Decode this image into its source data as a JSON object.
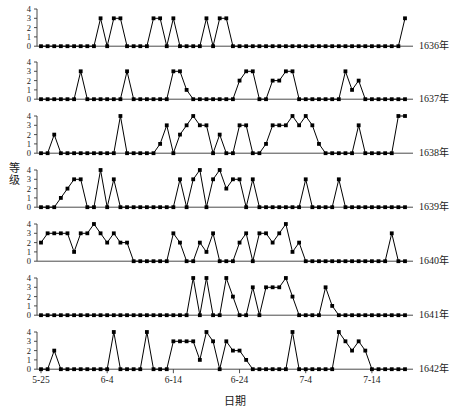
{
  "chart_data": {
    "type": "line",
    "title": "",
    "xlabel": "日期",
    "ylabel": "等级",
    "ylim": [
      0,
      4
    ],
    "yticks": [
      0,
      1,
      2,
      3,
      4
    ],
    "grid": false,
    "legend_position": "right",
    "x_start_label": "5-25",
    "x_tick_labels": [
      "5-25",
      "6-4",
      "6-14",
      "6-24",
      "7-4",
      "7-14"
    ],
    "x_tick_indices": [
      0,
      10,
      20,
      30,
      40,
      50
    ],
    "n_points": 56,
    "series": [
      {
        "name": "1636年",
        "values": [
          0,
          0,
          0,
          0,
          0,
          0,
          0,
          0,
          0,
          3,
          0,
          3,
          3,
          0,
          0,
          0,
          0,
          3,
          3,
          0,
          3,
          0,
          0,
          0,
          0,
          3,
          0,
          3,
          3,
          0,
          0,
          0,
          0,
          0,
          0,
          0,
          0,
          0,
          0,
          0,
          0,
          0,
          0,
          0,
          0,
          0,
          0,
          0,
          0,
          0,
          0,
          0,
          0,
          0,
          0,
          3
        ]
      },
      {
        "name": "1637年",
        "values": [
          0,
          0,
          0,
          0,
          0,
          0,
          3,
          0,
          0,
          0,
          0,
          0,
          0,
          3,
          0,
          0,
          0,
          0,
          0,
          0,
          3,
          3,
          1,
          0,
          0,
          0,
          0,
          0,
          0,
          0,
          2,
          3,
          3,
          0,
          0,
          2,
          2,
          3,
          3,
          0,
          0,
          0,
          0,
          0,
          0,
          0,
          3,
          1,
          2,
          0,
          0,
          0,
          0,
          0,
          0,
          0
        ]
      },
      {
        "name": "1638年",
        "values": [
          0,
          0,
          2,
          0,
          0,
          0,
          0,
          0,
          0,
          0,
          0,
          0,
          4,
          0,
          0,
          0,
          0,
          0,
          1,
          3,
          0,
          2,
          3,
          4,
          3,
          3,
          0,
          2,
          0,
          0,
          3,
          3,
          0,
          0,
          1,
          3,
          3,
          3,
          4,
          3,
          4,
          3,
          1,
          0,
          0,
          0,
          0,
          0,
          3,
          0,
          0,
          0,
          0,
          0,
          4,
          4
        ]
      },
      {
        "name": "1639年",
        "values": [
          0,
          0,
          0,
          1,
          2,
          3,
          3,
          0,
          0,
          4,
          0,
          3,
          0,
          0,
          0,
          0,
          0,
          0,
          0,
          0,
          0,
          3,
          0,
          3,
          4,
          0,
          3,
          4,
          2,
          3,
          3,
          0,
          3,
          0,
          0,
          0,
          0,
          0,
          0,
          0,
          3,
          0,
          0,
          0,
          0,
          3,
          0,
          0,
          0,
          0,
          0,
          0,
          0,
          0,
          0,
          0
        ]
      },
      {
        "name": "1640年",
        "values": [
          2,
          3,
          3,
          3,
          3,
          1,
          3,
          3,
          4,
          3,
          2,
          3,
          2,
          2,
          0,
          0,
          0,
          0,
          0,
          0,
          3,
          2,
          0,
          0,
          2,
          1,
          3,
          0,
          0,
          0,
          2,
          3,
          0,
          3,
          3,
          2,
          3,
          4,
          1,
          2,
          0,
          0,
          0,
          0,
          0,
          0,
          0,
          0,
          0,
          0,
          0,
          0,
          0,
          3,
          0,
          0
        ]
      },
      {
        "name": "1641年",
        "values": [
          0,
          0,
          0,
          0,
          0,
          0,
          0,
          0,
          0,
          0,
          0,
          0,
          0,
          0,
          0,
          0,
          0,
          0,
          0,
          0,
          0,
          0,
          0,
          4,
          0,
          4,
          0,
          0,
          4,
          2,
          0,
          0,
          3,
          0,
          3,
          3,
          3,
          4,
          2,
          0,
          0,
          0,
          0,
          3,
          1,
          0,
          0,
          0,
          0,
          0,
          0,
          0,
          0,
          0,
          0,
          0
        ]
      },
      {
        "name": "1642年",
        "values": [
          0,
          0,
          2,
          0,
          0,
          0,
          0,
          0,
          0,
          0,
          0,
          4,
          0,
          0,
          0,
          0,
          4,
          0,
          0,
          0,
          3,
          3,
          3,
          3,
          1,
          4,
          3,
          0,
          3,
          2,
          2,
          1,
          0,
          0,
          0,
          0,
          0,
          0,
          4,
          0,
          0,
          0,
          0,
          0,
          0,
          4,
          3,
          2,
          3,
          2,
          0,
          0,
          0,
          0,
          0,
          0
        ]
      }
    ]
  },
  "axis": {
    "y_tick_labels": [
      "0",
      "1",
      "2",
      "3",
      "4"
    ],
    "x_tick_labels": [
      "5-25",
      "6-4",
      "6-14",
      "6-24",
      "7-4",
      "7-14"
    ],
    "ylabel": "等级",
    "xlabel": "日期"
  },
  "panels": [
    {
      "label": "1636年"
    },
    {
      "label": "1637年"
    },
    {
      "label": "1638年"
    },
    {
      "label": "1639年"
    },
    {
      "label": "1640年"
    },
    {
      "label": "1641年"
    },
    {
      "label": "1642年"
    }
  ],
  "colors": {
    "line": "#000000",
    "marker": "#000000",
    "axis": "#4a4a4a",
    "background": "#ffffff"
  }
}
